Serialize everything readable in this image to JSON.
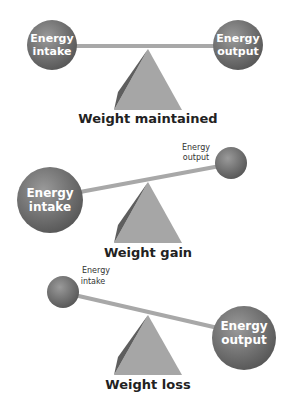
{
  "colors": {
    "ball": "#6e6e6e",
    "ball_highlight": "#9a9a9a",
    "bar": "#a8a8a8",
    "pyramid_face": "#a6a6a6",
    "pyramid_shadow": "#5e5e5e",
    "caption_text": "#222222"
  },
  "panels": [
    {
      "caption": "Weight maintained",
      "left_ball": {
        "line1": "Energy",
        "line2": "intake"
      },
      "right_ball": {
        "line1": "Energy",
        "line2": "output"
      }
    },
    {
      "caption": "Weight gain",
      "left_ball": {
        "line1": "Energy",
        "line2": "intake"
      },
      "right_ball": {
        "line1": "Energy",
        "line2": "output"
      }
    },
    {
      "caption": "Weight loss",
      "left_ball": {
        "line1": "Energy",
        "line2": "intake"
      },
      "right_ball": {
        "line1": "Energy",
        "line2": "output"
      }
    }
  ]
}
